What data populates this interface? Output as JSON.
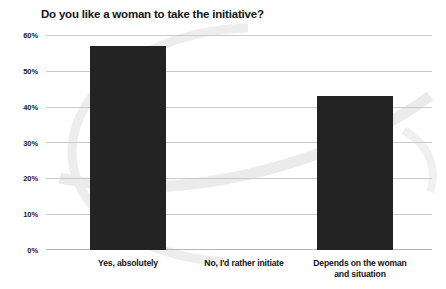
{
  "chart_data": {
    "type": "bar",
    "title": "Do you like a woman to take the initiative?",
    "xlabel": "",
    "ylabel": "",
    "categories": [
      "Yes, absolutely",
      "No, I'd rather initiate",
      "Depends on the woman and situation"
    ],
    "values": [
      57,
      0,
      43
    ],
    "value_labels": [
      "57%",
      "0%",
      "43%"
    ],
    "ylim": [
      0,
      60
    ],
    "ytick_labels": [
      "0%",
      "10%",
      "20%",
      "30%",
      "40%",
      "50%",
      "60%"
    ],
    "ytick_values": [
      0,
      10,
      20,
      30,
      40,
      50,
      60
    ],
    "grid": true,
    "legend": false,
    "legend_position": "none",
    "bar_color": "#232323",
    "gridline_color": "#c9c9c9",
    "background_color": "#ffffff",
    "title_color": "#151515",
    "label_color": "#141414",
    "watermark_color": "#ececec"
  }
}
